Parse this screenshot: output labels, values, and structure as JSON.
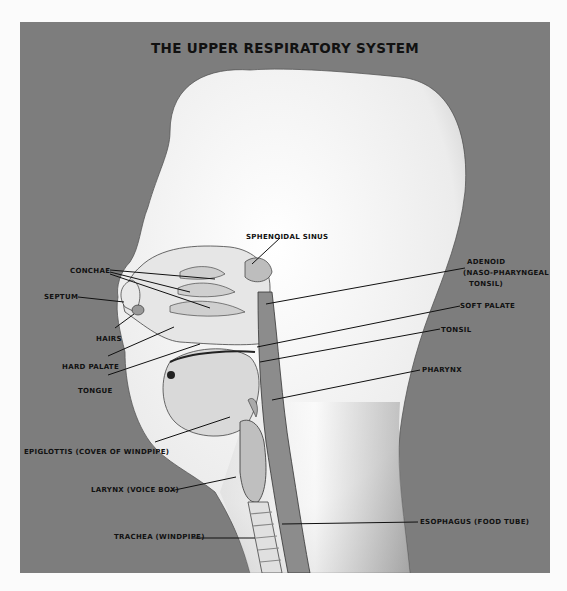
{
  "title": "THE UPPER RESPIRATORY SYSTEM",
  "colors": {
    "background": "#fbfbfb",
    "panel": "#7d7d7d",
    "head": "#f2f2f2",
    "label_text": "#111111"
  },
  "labels": {
    "sphenoidal_sinus": "SPHENOIDAL SINUS",
    "conchae": "CONCHAE",
    "septum": "SEPTUM",
    "hairs": "HAIRS",
    "hard_palate": "HARD PALATE",
    "tongue": "TONGUE",
    "adenoid_1": "ADENOID",
    "adenoid_2": "(NASO-PHARYNGEAL",
    "adenoid_3": "TONSIL)",
    "soft_palate": "SOFT PALATE",
    "tonsil": "TONSIL",
    "pharynx": "PHARYNX",
    "epiglottis": "EPIGLOTTIS (COVER OF WINDPIPE)",
    "larynx": "LARYNX (VOICE BOX)",
    "trachea": "TRACHEA (WINDPIPE)",
    "esophagus": "ESOPHAGUS (FOOD TUBE)"
  }
}
